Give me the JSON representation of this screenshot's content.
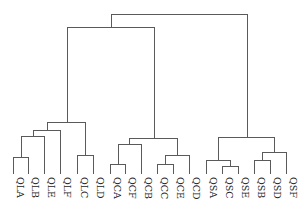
{
  "diagram": {
    "type": "dendrogram",
    "orientation": "top-down",
    "line_color": "#5a5a5a",
    "leaf_baseline_y": 174,
    "leaves": [
      {
        "label": "QLA",
        "x": 13
      },
      {
        "label": "QLB",
        "x": 28
      },
      {
        "label": "QLE",
        "x": 44
      },
      {
        "label": "QLF",
        "x": 60
      },
      {
        "label": "QLC",
        "x": 77
      },
      {
        "label": "QLD",
        "x": 93
      },
      {
        "label": "QCA",
        "x": 110
      },
      {
        "label": "QCF",
        "x": 125
      },
      {
        "label": "QCB",
        "x": 141
      },
      {
        "label": "QCC",
        "x": 157
      },
      {
        "label": "QCE",
        "x": 173
      },
      {
        "label": "QCD",
        "x": 189
      },
      {
        "label": "QSA",
        "x": 206
      },
      {
        "label": "QSC",
        "x": 222
      },
      {
        "label": "QSE",
        "x": 238
      },
      {
        "label": "QSB",
        "x": 254
      },
      {
        "label": "QSD",
        "x": 270
      },
      {
        "label": "QSF",
        "x": 286
      }
    ],
    "merges": [
      {
        "name": "QLA+QLB",
        "left_x": 13,
        "right_x": 28,
        "y": 157,
        "left_from_y": 174,
        "right_from_y": 174
      },
      {
        "name": "(QLA,QLB)+QLE",
        "left_x": 21,
        "right_x": 44,
        "y": 136,
        "left_from_y": 157,
        "right_from_y": 174
      },
      {
        "name": "(...)+QLF",
        "left_x": 33,
        "right_x": 60,
        "y": 130,
        "left_from_y": 136,
        "right_from_y": 174
      },
      {
        "name": "QLC+QLD",
        "left_x": 77,
        "right_x": 93,
        "y": 155,
        "left_from_y": 174,
        "right_from_y": 174
      },
      {
        "name": "QL cluster",
        "left_x": 47,
        "right_x": 85,
        "y": 122,
        "left_from_y": 130,
        "right_from_y": 155
      },
      {
        "name": "QCA+QCF",
        "left_x": 110,
        "right_x": 125,
        "y": 164,
        "left_from_y": 174,
        "right_from_y": 174
      },
      {
        "name": "(QCA,QCF)+QCB",
        "left_x": 118,
        "right_x": 141,
        "y": 144,
        "left_from_y": 164,
        "right_from_y": 174
      },
      {
        "name": "QCC+QCE",
        "left_x": 157,
        "right_x": 173,
        "y": 164,
        "left_from_y": 174,
        "right_from_y": 174
      },
      {
        "name": "(QCC,QCE)+QCD",
        "left_x": 165,
        "right_x": 189,
        "y": 155,
        "left_from_y": 164,
        "right_from_y": 174
      },
      {
        "name": "QC cluster",
        "left_x": 129,
        "right_x": 177,
        "y": 138,
        "left_from_y": 144,
        "right_from_y": 155
      },
      {
        "name": "QSC+QSE",
        "left_x": 222,
        "right_x": 238,
        "y": 166,
        "left_from_y": 174,
        "right_from_y": 174
      },
      {
        "name": "QSA+(QSC,QSE)",
        "left_x": 206,
        "right_x": 230,
        "y": 160,
        "left_from_y": 174,
        "right_from_y": 166
      },
      {
        "name": "QSB+QSD",
        "left_x": 254,
        "right_x": 270,
        "y": 160,
        "left_from_y": 174,
        "right_from_y": 174
      },
      {
        "name": "(QSB,QSD)+QSF",
        "left_x": 262,
        "right_x": 286,
        "y": 152,
        "left_from_y": 160,
        "right_from_y": 174
      },
      {
        "name": "QS cluster",
        "left_x": 218,
        "right_x": 274,
        "y": 137,
        "left_from_y": 160,
        "right_from_y": 152
      },
      {
        "name": "QL+QC",
        "left_x": 67,
        "right_x": 154,
        "y": 27,
        "left_from_y": 122,
        "right_from_y": 138
      },
      {
        "name": "root",
        "left_x": 111,
        "right_x": 247,
        "y": 14,
        "left_from_y": 27,
        "right_from_y": 137
      }
    ]
  }
}
